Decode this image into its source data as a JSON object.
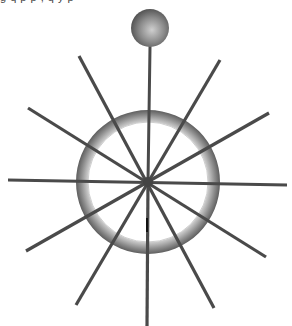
{
  "figure": {
    "top_text_fragment": "g  q   p  p   ,   q  y   p",
    "canvas": {
      "width": 292,
      "height": 326,
      "background": "#ffffff"
    },
    "colors": {
      "spoke": "#4a4a4a",
      "hub": "#444444",
      "ring_outer": "#5e5e5e",
      "ring_mid": "#9a9a9a",
      "ring_inner": "#d8d8d8",
      "sphere_light": "#c8c8c8",
      "sphere_dark": "#4e4e4e",
      "cursor": "#111111"
    },
    "hub": {
      "cx": 148,
      "cy": 182,
      "r": 5
    },
    "ring": {
      "cx": 148,
      "cy": 182,
      "r_outer": 72,
      "r_inner": 60
    },
    "sphere": {
      "cx": 150,
      "cy": 28,
      "r": 19
    },
    "rod": {
      "x1": 150,
      "y1": 47,
      "x2": 148,
      "y2": 182
    },
    "spokes": [
      {
        "x1": 79,
        "y1": 56,
        "x2": 214,
        "y2": 308
      },
      {
        "x1": 28,
        "y1": 108,
        "x2": 266,
        "y2": 257
      },
      {
        "x1": 8,
        "y1": 180,
        "x2": 287,
        "y2": 185
      },
      {
        "x1": 26,
        "y1": 251,
        "x2": 269,
        "y2": 113
      },
      {
        "x1": 76,
        "y1": 305,
        "x2": 220,
        "y2": 60
      },
      {
        "x1": 148,
        "y1": 182,
        "x2": 147,
        "y2": 326
      }
    ],
    "cursor_mark": {
      "x": 147,
      "y1": 218,
      "y2": 232
    }
  }
}
